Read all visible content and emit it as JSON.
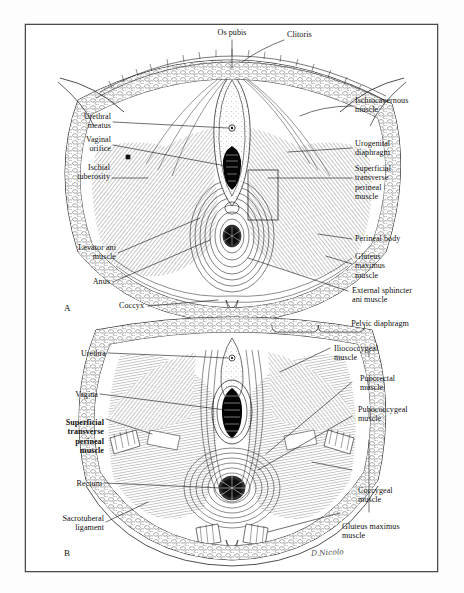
{
  "figure": {
    "artist_signature": "D.Nicolo",
    "frame_color": "#4a4a4a",
    "ink_color": "#101010",
    "panel_a_letter": "A",
    "panel_b_letter": "B"
  },
  "panel_a": {
    "letter": "A",
    "labels_top": [
      {
        "text": "Os pubis",
        "side": "top"
      },
      {
        "text": "Clitoris",
        "side": "top-right"
      }
    ],
    "labels_left": [
      {
        "text": "Urethral\nmeatus"
      },
      {
        "text": "Vaginal\norifice"
      },
      {
        "text": "Ischial\ntuberosity"
      },
      {
        "text": "Levator ani\nmuscle"
      },
      {
        "text": "Anus"
      },
      {
        "text": "Coccyx"
      }
    ],
    "labels_right": [
      {
        "text": "Ischiocavernous\nmuscle"
      },
      {
        "text": "Urogenital\ndiaphragm"
      },
      {
        "text": "Superficial\ntransverse\nperineal\nmuscle"
      },
      {
        "text": "Perineal body"
      },
      {
        "text": "Gluteus\nmaximus\nmuscle"
      },
      {
        "text": "External sphincter\nani muscle"
      }
    ]
  },
  "panel_b": {
    "letter": "B",
    "bracket_title": "Pelvic diaphragm",
    "labels_left": [
      {
        "text": "Urethra",
        "bold": false
      },
      {
        "text": "Vagina",
        "bold": false
      },
      {
        "text": "Superficial\ntransverse\nperineal\nmuscle",
        "bold": true
      },
      {
        "text": "Rectum",
        "bold": false
      },
      {
        "text": "Sacrotuberal\nligament",
        "bold": false
      }
    ],
    "labels_right": [
      {
        "text": "Iliococcygeal\nmuscle",
        "in_bracket": true
      },
      {
        "text": "Puborectal\nmuscle",
        "in_bracket": true
      },
      {
        "text": "Pubococcygeal\nmuscle",
        "in_bracket": true
      },
      {
        "text": "Coccygeal\nmuscle",
        "in_bracket": true
      },
      {
        "text": "Gluteus maximus\nmuscle",
        "in_bracket": false
      }
    ]
  }
}
